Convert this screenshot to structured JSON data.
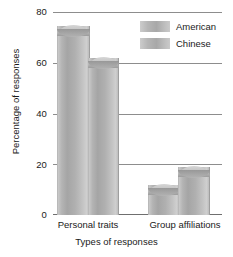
{
  "chart_data": {
    "type": "bar",
    "title": "",
    "xlabel": "Types of responses",
    "ylabel": "Percentage of responses",
    "categories": [
      "Personal traits",
      "Group affiliations"
    ],
    "series": [
      {
        "name": "American",
        "values": [
          75,
          12
        ]
      },
      {
        "name": "Chinese",
        "values": [
          62,
          19
        ]
      }
    ],
    "ylim": [
      0,
      80
    ],
    "yticks": [
      0,
      20,
      40,
      60,
      80
    ],
    "ytick_labels": [
      "0",
      "20",
      "40",
      "60",
      "80"
    ],
    "grid": true,
    "legend_position": "top-right-inside",
    "colors": {
      "american_bar": "#b4b4b4",
      "chinese_bar": "#b4b4b4",
      "gridline": "#8d8d8d",
      "text": "#1a1a1a",
      "background": "#ffffff"
    }
  },
  "axis": {
    "y": {
      "label": "Percentage of responses",
      "ticks": [
        {
          "value": "80"
        },
        {
          "value": "60"
        },
        {
          "value": "40"
        },
        {
          "value": "20"
        },
        {
          "value": "0"
        }
      ]
    },
    "x": {
      "label": "Types of responses",
      "categories": [
        {
          "label": "Personal traits"
        },
        {
          "label": "Group affiliations"
        }
      ]
    }
  },
  "legend": {
    "items": [
      {
        "label": "American"
      },
      {
        "label": "Chinese"
      }
    ]
  }
}
